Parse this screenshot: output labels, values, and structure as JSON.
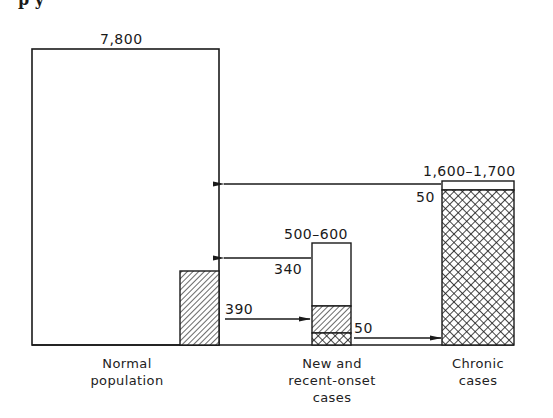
{
  "figure": {
    "top_fragment": "p y",
    "colors": {
      "ink": "#1a1a1a",
      "background": "#ffffff"
    },
    "patterns": {
      "hatched": "diagonal-hatch",
      "crosshatched": "cross-hatch"
    }
  },
  "bars": [
    {
      "id": "normal-population",
      "category": [
        "Normal",
        "population"
      ],
      "total_label": "7,800",
      "segments": [
        {
          "pattern": "empty"
        }
      ],
      "side_bar": {
        "pattern": "hatched"
      }
    },
    {
      "id": "new-recent-onset",
      "category": [
        "New and",
        "recent-onset",
        "cases"
      ],
      "total_label": "500–600",
      "segments": [
        {
          "pattern": "empty"
        },
        {
          "pattern": "hatched"
        },
        {
          "pattern": "crosshatched"
        }
      ]
    },
    {
      "id": "chronic",
      "category": [
        "Chronic",
        "cases"
      ],
      "total_label": "1,600–1,700",
      "segments": [
        {
          "pattern": "empty"
        },
        {
          "pattern": "crosshatched"
        }
      ]
    }
  ],
  "flows": [
    {
      "from": "chronic",
      "to": "normal-population",
      "value": "50",
      "direction": "left"
    },
    {
      "from": "new-recent-onset",
      "to": "normal-population",
      "value": "340",
      "direction": "left"
    },
    {
      "from": "normal-population",
      "to": "new-recent-onset",
      "value": "390",
      "direction": "right"
    },
    {
      "from": "new-recent-onset",
      "to": "chronic",
      "value": "50",
      "direction": "right"
    }
  ]
}
